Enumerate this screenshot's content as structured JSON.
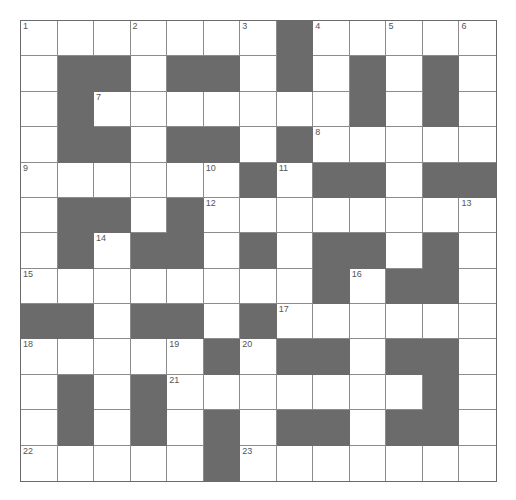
{
  "puzzle": {
    "rows": 13,
    "cols": 13,
    "colors": {
      "black_cell": "#6b6b6b",
      "white_cell": "#ffffff",
      "grid_line": "#8c8c8c",
      "border": "#6a6a6a",
      "number_text": "#555555"
    },
    "grid": [
      "WWWWWWWBWWWWW",
      "WBBWBBWBWBWBW",
      "WBWWWWWWWBWBW",
      "WBBWBBWBWWWWW",
      "WWWWWWBWBBWBB",
      "WBBWBWWWWWWWW",
      "WBWBBWBWBBWBW",
      "WWWWWWWWBWBBW",
      "BBWBBWBWWWWWW",
      "WWWWWBWBBWBBW",
      "WBWBWWWWWWWBW",
      "WBWBWBWBBWBBW",
      "WWWWWBWWWWWWW"
    ],
    "numbers": [
      {
        "row": 0,
        "col": 0,
        "label": "1"
      },
      {
        "row": 0,
        "col": 3,
        "label": "2"
      },
      {
        "row": 0,
        "col": 6,
        "label": "3"
      },
      {
        "row": 0,
        "col": 8,
        "label": "4"
      },
      {
        "row": 0,
        "col": 10,
        "label": "5"
      },
      {
        "row": 0,
        "col": 12,
        "label": "6"
      },
      {
        "row": 2,
        "col": 2,
        "label": "7"
      },
      {
        "row": 3,
        "col": 8,
        "label": "8"
      },
      {
        "row": 4,
        "col": 0,
        "label": "9"
      },
      {
        "row": 4,
        "col": 5,
        "label": "10"
      },
      {
        "row": 4,
        "col": 7,
        "label": "11"
      },
      {
        "row": 5,
        "col": 5,
        "label": "12"
      },
      {
        "row": 5,
        "col": 12,
        "label": "13"
      },
      {
        "row": 6,
        "col": 2,
        "label": "14"
      },
      {
        "row": 7,
        "col": 0,
        "label": "15"
      },
      {
        "row": 7,
        "col": 9,
        "label": "16"
      },
      {
        "row": 8,
        "col": 7,
        "label": "17"
      },
      {
        "row": 9,
        "col": 0,
        "label": "18"
      },
      {
        "row": 9,
        "col": 4,
        "label": "19"
      },
      {
        "row": 9,
        "col": 6,
        "label": "20"
      },
      {
        "row": 10,
        "col": 4,
        "label": "21"
      },
      {
        "row": 12,
        "col": 0,
        "label": "22"
      },
      {
        "row": 12,
        "col": 6,
        "label": "23"
      }
    ]
  }
}
